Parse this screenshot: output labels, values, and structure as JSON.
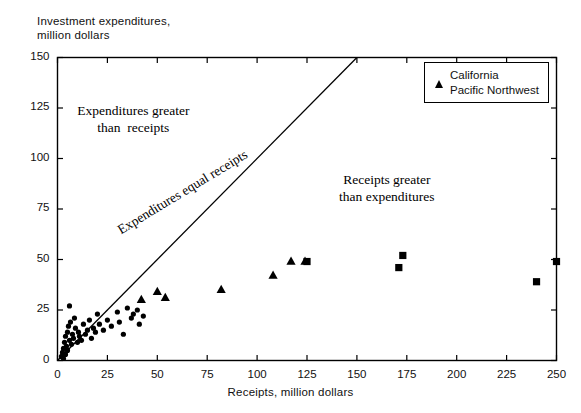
{
  "chart_data": {
    "type": "scatter",
    "title": "",
    "ylabel": "Investment expenditures,\nmillion dollars",
    "xlabel": "Receipts,  million dollars",
    "xlim": [
      0,
      250
    ],
    "ylim": [
      0,
      150
    ],
    "xticks": [
      0,
      25,
      50,
      75,
      100,
      125,
      150,
      175,
      200,
      225,
      250
    ],
    "yticks": [
      0,
      25,
      50,
      75,
      100,
      125,
      150
    ],
    "grid": false,
    "legend_position": "top-right",
    "annotations": [
      {
        "name": "upper-left-region-label",
        "text": "Expenditures greater\nthan  receipts",
        "x": 38,
        "y": 122
      },
      {
        "name": "lower-right-region-label",
        "text": "Receipts greater\nthan expenditures",
        "x": 165,
        "y": 88
      },
      {
        "name": "diagonal-line-label",
        "text": "Expenditures equal receipts",
        "x": 75,
        "y": 75
      }
    ],
    "reference_line": {
      "name": "equality-line",
      "from": [
        0,
        0
      ],
      "to": [
        150,
        150
      ]
    },
    "series": [
      {
        "name": "Unlabeled cluster",
        "marker": "circle",
        "points": [
          [
            2,
            2
          ],
          [
            2.5,
            4
          ],
          [
            3,
            1
          ],
          [
            3,
            6
          ],
          [
            3.5,
            9
          ],
          [
            4,
            3
          ],
          [
            4,
            12
          ],
          [
            4.5,
            7
          ],
          [
            5,
            14
          ],
          [
            5,
            5
          ],
          [
            5.5,
            17
          ],
          [
            6,
            10
          ],
          [
            6,
            27
          ],
          [
            6.5,
            19
          ],
          [
            7,
            8
          ],
          [
            7.5,
            13
          ],
          [
            8,
            11
          ],
          [
            8.5,
            21
          ],
          [
            9,
            16
          ],
          [
            10,
            9
          ],
          [
            10.5,
            14
          ],
          [
            11,
            12
          ],
          [
            12,
            10
          ],
          [
            13,
            18
          ],
          [
            14,
            13
          ],
          [
            15,
            15
          ],
          [
            16,
            20
          ],
          [
            17,
            11
          ],
          [
            18,
            16
          ],
          [
            19,
            14
          ],
          [
            20,
            23
          ],
          [
            21,
            18
          ],
          [
            23,
            15
          ],
          [
            25,
            20
          ],
          [
            27,
            17
          ],
          [
            30,
            24
          ],
          [
            31,
            19
          ],
          [
            33,
            13
          ],
          [
            35,
            26
          ],
          [
            37,
            21
          ],
          [
            38,
            23
          ],
          [
            40,
            25
          ],
          [
            41,
            18
          ],
          [
            43,
            22
          ]
        ]
      },
      {
        "name": "California",
        "marker": "triangle",
        "points": [
          [
            42,
            30
          ],
          [
            50,
            34
          ],
          [
            54,
            31
          ],
          [
            82,
            35
          ],
          [
            108,
            42
          ],
          [
            117,
            49
          ],
          [
            124,
            49
          ]
        ]
      },
      {
        "name": "Pacific Northwest",
        "marker": "square",
        "points": [
          [
            125,
            49
          ],
          [
            171,
            46
          ],
          [
            173,
            52
          ],
          [
            240,
            39
          ],
          [
            250,
            49
          ]
        ]
      }
    ]
  },
  "legend": {
    "items": [
      {
        "label": "California",
        "marker": "triangle"
      },
      {
        "label": "Pacific Northwest",
        "marker": "square"
      }
    ]
  }
}
